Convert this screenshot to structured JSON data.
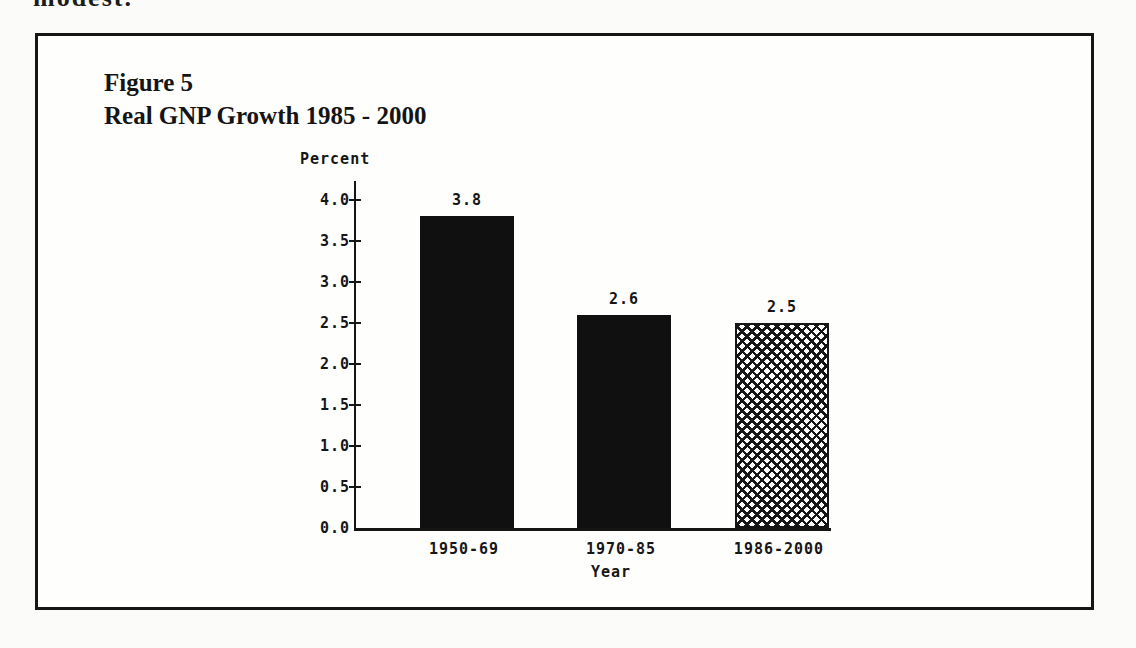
{
  "page": {
    "top_text": "modest."
  },
  "figure": {
    "label": "Figure 5",
    "title": "Real GNP Growth 1985 - 2000"
  },
  "chart_data": {
    "type": "bar",
    "title": "Real GNP Growth 1985 - 2000",
    "categories": [
      "1950-69",
      "1970-85",
      "1986-2000"
    ],
    "values": [
      3.8,
      2.6,
      2.5
    ],
    "bar_value_labels": [
      "3.8",
      "2.6",
      "2.5"
    ],
    "bar_styles": [
      "solid",
      "solid",
      "crosshatch"
    ],
    "xlabel": "Year",
    "ylabel": "Percent",
    "ylim": [
      0.0,
      4.0
    ],
    "ytick_interval": 0.5,
    "ytick_labels": [
      "4.0",
      "3.5",
      "3.0",
      "2.5",
      "2.0",
      "1.5",
      "1.0",
      "0.5",
      "0.0"
    ],
    "grid": false,
    "legend_position": "none",
    "colors": {
      "bar_fill": "#101010",
      "axis": "#151515",
      "plot_background": "#ffffff"
    }
  }
}
